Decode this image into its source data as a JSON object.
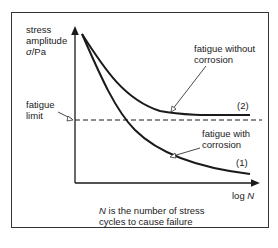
{
  "diagram": {
    "y_axis_label": [
      "stress",
      "amplitude",
      "σ/Pa"
    ],
    "y_axis_label_line1": "stress",
    "y_axis_label_line2": "amplitude",
    "y_axis_symbol": "σ",
    "y_axis_unit": "/Pa",
    "x_axis_label_prefix": "log ",
    "x_axis_label_symbol": "N",
    "fatigue_limit_line1": "fatigue",
    "fatigue_limit_line2": "limit",
    "curve2_label_line1": "fatigue without",
    "curve2_label_line2": "corrosion",
    "curve2_number": "(2)",
    "curve1_label_line1": "fatigue with",
    "curve1_label_line2": "corrosion",
    "curve1_number": "(1)",
    "caption_symbol": "N",
    "caption_line1_rest": " is the number of stress",
    "caption_line2": "cycles to cause failure"
  },
  "colors": {
    "line": "#1a1a1a",
    "frame": "#333333",
    "background": "#ffffff"
  }
}
